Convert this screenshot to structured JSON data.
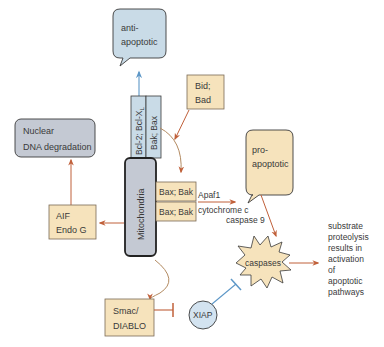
{
  "diagram": {
    "type": "apoptosis-mitochondrial-pathway",
    "colors": {
      "blue_fill": "#c9dbe7",
      "blue_stroke": "#3a3a3a",
      "gray_fill": "#c4c9d3",
      "tan_fill": "#f6e3bc",
      "tan_stroke": "#7a6a55",
      "arrow_orange": "#c0603a",
      "arrow_tan": "#b38b62",
      "arrow_blue": "#5d97c7",
      "xiap_fill": "#d3e3f0"
    },
    "nodes": {
      "anti_apoptotic": {
        "line1": "anti-",
        "line2": "apoptotic"
      },
      "bcl2_bar": {
        "label": "Bcl-2; Bcl-X",
        "subscript": "L"
      },
      "bak_bax_bar": {
        "label": "Bak; Bax"
      },
      "bid_bad": {
        "line1": "Bid;",
        "line2": "Bad"
      },
      "nuclear": {
        "line1": "Nuclear",
        "line2": "DNA degradation"
      },
      "mitochondria": {
        "label": "Mitochondria"
      },
      "bax_bak_1": {
        "label": "Bax; Bak"
      },
      "bax_bak_2": {
        "label": "Bax; Bak"
      },
      "aif_endo": {
        "line1": "AIF",
        "line2": "Endo G"
      },
      "pro_apoptotic": {
        "line1": "pro-",
        "line2": "apoptotic"
      },
      "apaf1": {
        "label": "Apaf1"
      },
      "cytochrome": {
        "label": "cytochrome c"
      },
      "caspase9": {
        "label": "caspase 9"
      },
      "caspases": {
        "label": "caspases"
      },
      "outcome": {
        "lines": [
          "substrate",
          "proteolysis",
          "results in",
          "activation",
          "of",
          "apoptotic",
          "pathways"
        ]
      },
      "smac": {
        "line1": "Smac/",
        "line2": "DIABLO"
      },
      "xiap": {
        "label": "XIAP"
      }
    }
  }
}
